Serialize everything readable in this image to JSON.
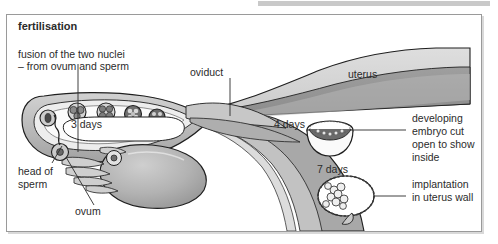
{
  "figure": {
    "title": "fertilisation",
    "labels": {
      "fusion_line1": "fusion of the two nuclei",
      "fusion_line2": "– from ovum and sperm",
      "oviduct": "oviduct",
      "uterus": "uterus",
      "head_of_sperm_line1": "head of",
      "head_of_sperm_line2": "sperm",
      "ovum": "ovum",
      "developing_embryo_line1": "developing",
      "developing_embryo_line2": "embryo cut",
      "developing_embryo_line3": "open to show",
      "developing_embryo_line4": "inside",
      "implantation_line1": "implantation",
      "implantation_line2": "in uterus wall"
    },
    "stage_markers": {
      "three_days": "3 days",
      "four_days": "4 days",
      "seven_days": "7 days"
    },
    "colors": {
      "frame_border": "#9a9a9a",
      "top_strip": "#c9c9c9",
      "tissue_light": "#d9d9d9",
      "tissue_mid": "#b3b3b3",
      "tissue_dark": "#8f8f8f",
      "lumen": "#ffffff",
      "outline": "#1f1f1f",
      "text": "#2b2b2b"
    }
  }
}
